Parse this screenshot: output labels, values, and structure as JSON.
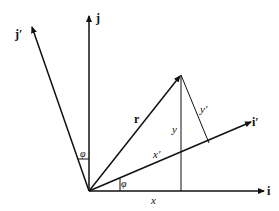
{
  "diagram": {
    "type": "coordinate-rotation",
    "vectors": {
      "i": "i",
      "j": "j",
      "i_prime": "i′",
      "j_prime": "j′",
      "r": "r"
    },
    "components": {
      "x": "x",
      "y": "y",
      "x_prime": "x′",
      "y_prime": "y′"
    },
    "angle_label": "φ",
    "colors": {
      "line": "#111111",
      "background": "#ffffff"
    }
  }
}
